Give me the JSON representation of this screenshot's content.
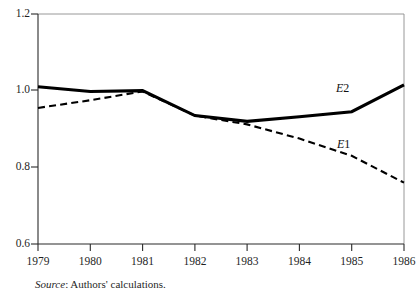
{
  "figure": {
    "source_note_prefix": "Source",
    "source_note_separator": ":",
    "source_note_text": " Authors' calculations."
  },
  "chart_data": {
    "type": "line",
    "title": "",
    "subtitle": "",
    "xlabel": "",
    "ylabel": "",
    "x": [
      1979,
      1980,
      1981,
      1982,
      1983,
      1984,
      1985,
      1986
    ],
    "xtick_labels": [
      "1979",
      "1980",
      "1981",
      "1982",
      "1983",
      "1984",
      "1985",
      "1986"
    ],
    "ytick_labels": [
      "0.6",
      "0.8",
      "1.0",
      "1.2"
    ],
    "ytick_values": [
      0.6,
      0.8,
      1.0,
      1.2
    ],
    "xlim": [
      1979,
      1986
    ],
    "ylim": [
      0.6,
      1.2
    ],
    "grid": false,
    "legend_position": "inline-annotations",
    "series": [
      {
        "name": "E2",
        "label_italic_part": "E",
        "label_plain_part": "2",
        "style": "solid",
        "linewidth": "thick",
        "color": "#000000",
        "values": [
          1.01,
          0.998,
          1.0,
          0.935,
          0.92,
          0.932,
          0.945,
          1.015
        ]
      },
      {
        "name": "E1",
        "label_italic_part": "E",
        "label_plain_part": "1",
        "style": "dashed",
        "linewidth": "medium",
        "color": "#000000",
        "values": [
          0.955,
          0.975,
          0.998,
          0.935,
          0.912,
          0.875,
          0.83,
          0.76
        ]
      }
    ],
    "annotations": [
      {
        "text": "E2",
        "x": 1985.0,
        "y": 1.012
      },
      {
        "text": "E1",
        "x": 1985.05,
        "y": 0.875
      }
    ]
  }
}
